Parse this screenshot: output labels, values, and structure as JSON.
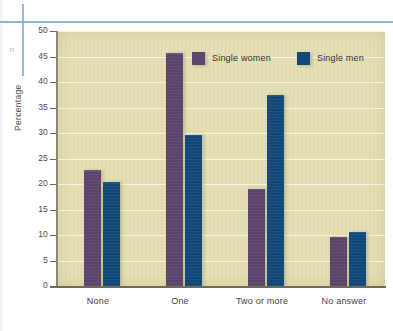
{
  "decor": {
    "margin_glyph": "n"
  },
  "chart_data": {
    "type": "bar",
    "title": "",
    "xlabel": "",
    "ylabel": "Percentage",
    "ylim": [
      0,
      50
    ],
    "yticks": [
      0,
      5,
      10,
      15,
      20,
      25,
      30,
      35,
      40,
      45,
      50
    ],
    "ytick_labels": [
      "0",
      "5",
      "10",
      "15",
      "20",
      "25",
      "30",
      "35",
      "40",
      "45",
      "50"
    ],
    "grid": true,
    "legend_position": "top-center",
    "categories": [
      "None",
      "One",
      "Two or more",
      "No answer"
    ],
    "series": [
      {
        "name": "Single women",
        "color": "#5d4670",
        "values": [
          22.6,
          45.5,
          18.8,
          9.4
        ]
      },
      {
        "name": "Single men",
        "color": "#12497a",
        "values": [
          20.2,
          29.5,
          37.2,
          10.4
        ]
      }
    ],
    "plot_background": "#e4dfb2",
    "gridline_color": "#f7f4e2"
  }
}
